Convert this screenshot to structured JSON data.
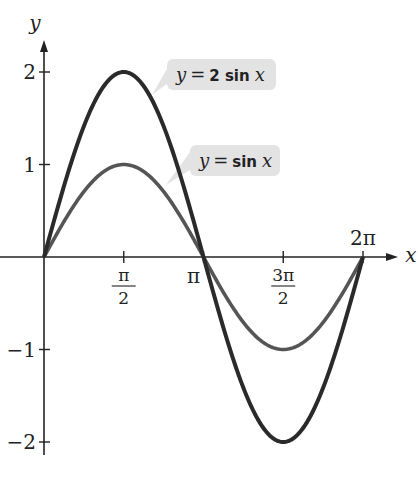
{
  "chart_data": {
    "type": "line",
    "title": "",
    "xlabel": "x",
    "ylabel": "y",
    "xlim_radians": [
      0,
      6.283185307
    ],
    "ylim": [
      -2,
      2
    ],
    "grid": false,
    "x_ticks": [
      {
        "value_over_pi": 0.5,
        "label_num": "π",
        "label_den": "2"
      },
      {
        "value_over_pi": 1.0,
        "label": "π"
      },
      {
        "value_over_pi": 1.5,
        "label_num": "3π",
        "label_den": "2"
      },
      {
        "value_over_pi": 2.0,
        "label": "2π"
      }
    ],
    "y_ticks": [
      {
        "value": 2,
        "label": "2"
      },
      {
        "value": 1,
        "label": "1"
      },
      {
        "value": -1,
        "label": "−1"
      },
      {
        "value": -2,
        "label": "−2"
      }
    ],
    "series": [
      {
        "name": "y = 2 sin x",
        "amplitude": 2,
        "function": "2*sin(x)",
        "label_y": "y",
        "label_eq": "=",
        "label_coef": "2 sin",
        "label_x": "x",
        "x_pi": [
          0,
          0.5,
          1,
          1.5,
          2
        ],
        "y": [
          0,
          2,
          0,
          -2,
          0
        ],
        "color": "#2a2a2a"
      },
      {
        "name": "y = sin x",
        "amplitude": 1,
        "function": "sin(x)",
        "label_y": "y",
        "label_eq": "=",
        "label_coef": "sin",
        "label_x": "x",
        "x_pi": [
          0,
          0.5,
          1,
          1.5,
          2
        ],
        "y": [
          0,
          1,
          0,
          -1,
          0
        ],
        "color": "#555555"
      }
    ],
    "callout_color": "#e3e3e3"
  }
}
